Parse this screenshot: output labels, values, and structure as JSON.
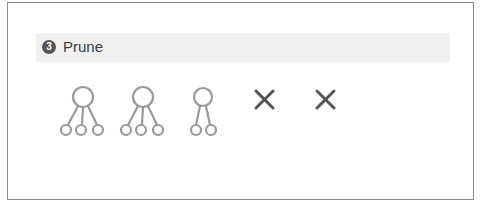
{
  "step": {
    "number": "3",
    "title": "Prune"
  },
  "colors": {
    "node_stroke": "#9a9a9a",
    "cross_stroke": "#555555",
    "band": "#f0f0f0",
    "badge": "#555555"
  },
  "diagram": {
    "trees": [
      {
        "children": 3
      },
      {
        "children": 3
      },
      {
        "children": 2
      }
    ],
    "pruned_markers": 2
  }
}
